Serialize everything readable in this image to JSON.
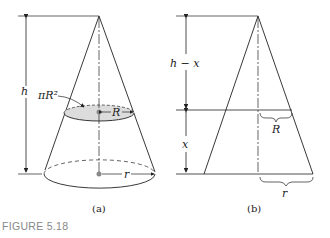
{
  "figure": {
    "caption": "FIGURE 5.18",
    "panel_a": {
      "label": "(a)",
      "height_label": "h",
      "area_label": "πR²",
      "slice_radius_label": "R",
      "base_radius_label": "r"
    },
    "panel_b": {
      "label": "(b)",
      "upper_label": "h − x",
      "lower_label": "x",
      "slice_radius_label": "R",
      "base_radius_label": "r"
    }
  }
}
